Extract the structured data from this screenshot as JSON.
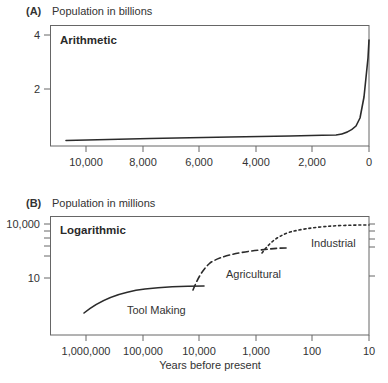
{
  "chart_data": [
    {
      "panel": "(A)",
      "type": "line",
      "title": "Population in billions",
      "scale_label": "Arithmetic",
      "xlabel": "",
      "ylabel": "Population in billions",
      "x_ticks": [
        "10,000",
        "8,000",
        "6,000",
        "4,000",
        "2,000",
        "0"
      ],
      "y_ticks": [
        "4",
        "2"
      ],
      "xlim": [
        11250,
        0
      ],
      "ylim": [
        0,
        4.4
      ],
      "x_reversed": true,
      "grid": false,
      "series": [
        {
          "name": "World population",
          "style": "solid",
          "x": [
            10600,
            8000,
            6000,
            4000,
            2000,
            1500,
            1000,
            700,
            400,
            200,
            0
          ],
          "y": [
            0.01,
            0.05,
            0.08,
            0.12,
            0.2,
            0.3,
            0.45,
            0.6,
            1.2,
            2.3,
            4.0
          ]
        }
      ]
    },
    {
      "panel": "(B)",
      "type": "line",
      "title": "Population in millions",
      "scale_label": "Logarithmic",
      "xlabel": "Years before present",
      "ylabel": "Population in millions",
      "x_scale": "log",
      "y_scale": "log",
      "x_ticks": [
        "1,000,000",
        "100,000",
        "10,000",
        "1,000",
        "100",
        "10"
      ],
      "y_ticks": [
        "10,000",
        "10"
      ],
      "x_reversed": true,
      "grid": false,
      "series": [
        {
          "name": "Tool Making",
          "style": "solid",
          "x": [
            1000000,
            300000,
            100000,
            30000,
            10000
          ],
          "y": [
            0.125,
            1,
            2.5,
            4,
            5
          ]
        },
        {
          "name": "Agricultural",
          "style": "dashed",
          "x": [
            12000,
            8000,
            5000,
            2000,
            1000,
            500
          ],
          "y": [
            4,
            30,
            150,
            250,
            300,
            300
          ]
        },
        {
          "name": "Industrial",
          "style": "dotted",
          "x": [
            1200,
            800,
            400,
            100,
            30,
            10
          ],
          "y": [
            200,
            900,
            3500,
            8000,
            10000,
            10000
          ]
        }
      ]
    }
  ],
  "panelA": {
    "letter": "(A)",
    "title": "Population in billions",
    "scale": "Arithmetic",
    "x_ticks": [
      {
        "label": "10,000",
        "x": 86
      },
      {
        "label": "8,000",
        "x": 143
      },
      {
        "label": "6,000",
        "x": 199
      },
      {
        "label": "4,000",
        "x": 256
      },
      {
        "label": "2,000",
        "x": 312
      },
      {
        "label": "0",
        "x": 369
      }
    ],
    "y_ticks": [
      {
        "label": "4",
        "y": 35
      },
      {
        "label": "2",
        "y": 89
      }
    ]
  },
  "panelB": {
    "letter": "(B)",
    "title": "Population in millions",
    "scale": "Logarithmic",
    "xlabel": "Years before present",
    "x_ticks": [
      {
        "label": "1,000,000",
        "x": 86
      },
      {
        "label": "100,000",
        "x": 143
      },
      {
        "label": "10,000",
        "x": 199
      },
      {
        "label": "1,000",
        "x": 256
      },
      {
        "label": "100",
        "x": 312
      },
      {
        "label": "10",
        "x": 369
      }
    ],
    "y_ticks": [
      {
        "label": "10,000",
        "y": 224
      },
      {
        "label": "10",
        "y": 278
      }
    ],
    "minor_y_left": [
      231,
      238,
      246,
      256
    ],
    "minor_y_right": [
      224,
      231,
      239,
      247,
      276
    ],
    "eras": [
      {
        "label": "Tool Making",
        "x": 127,
        "y": 314
      },
      {
        "label": "Agricultural",
        "x": 226,
        "y": 278
      },
      {
        "label": "Industrial",
        "x": 311,
        "y": 247
      }
    ]
  },
  "colors": {
    "line": "#2b2b2b",
    "axis": "#666666",
    "text": "#333333"
  }
}
